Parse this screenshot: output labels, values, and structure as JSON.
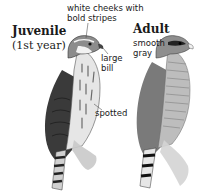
{
  "juvenile": {
    "title": "Juvenile",
    "subtitle": "(1st year)",
    "annotations": {
      "cheeks_line1": "white cheeks with",
      "cheeks_line2": "bold stripes",
      "bill_line1": "large",
      "bill_line2": "bill",
      "chest": "spotted"
    }
  },
  "adult": {
    "title": "Adult",
    "annotations": {
      "color_line1": "smooth",
      "color_line2": "gray"
    }
  },
  "colors": {
    "text": "#1a1a1a",
    "juvenile_back": "#3a3a3a",
    "juvenile_breast": "#d8d8d8",
    "adult_gray": "#8a8a8a",
    "adult_breast": "#bdbdbd",
    "leader_line": "#555555"
  }
}
